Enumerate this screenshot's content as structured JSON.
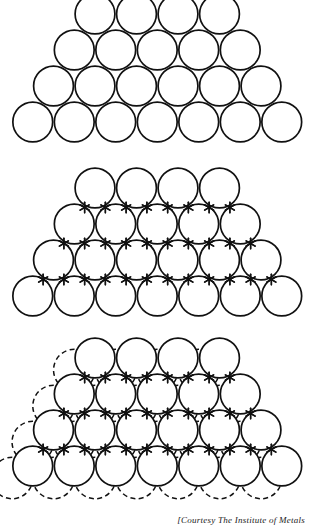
{
  "figure": {
    "caption": "[Courtesy The Institute of Metals",
    "ink_color": "#111111",
    "background_color": "#ffffff"
  },
  "diagram_data": {
    "type": "diagram",
    "subject": "close-packed sphere stacking (pyramid of equal spheres)",
    "panel_count": 3,
    "geometry": {
      "sphere_diameter": 41.5,
      "row_vertical_pitch": 36.0,
      "rows_top_to_bottom": [
        4,
        5,
        6,
        7
      ],
      "total_spheres_per_panel": 22,
      "first_row_left_x": 74,
      "bottom_row_left_x": 12,
      "bottom_row_right_x": 303
    },
    "panels": [
      {
        "id": "panel-plain-packing",
        "label": "plain close-packed layer",
        "top": 0,
        "show_spheres": true,
        "show_interstices": false,
        "show_hidden_layer": false
      },
      {
        "id": "panel-interstice-packing",
        "label": "close-packed layer with interstitial sites marked",
        "top": 174,
        "show_spheres": true,
        "show_interstices": true,
        "show_hidden_layer": false
      },
      {
        "id": "panel-second-layer-packing",
        "label": "close-packed layer with underlying layer shown dashed",
        "top": 344,
        "show_spheres": true,
        "show_interstices": true,
        "show_hidden_layer": true,
        "hidden_layer_offset": {
          "dx": -20.7,
          "dy": 12.0
        }
      }
    ]
  }
}
